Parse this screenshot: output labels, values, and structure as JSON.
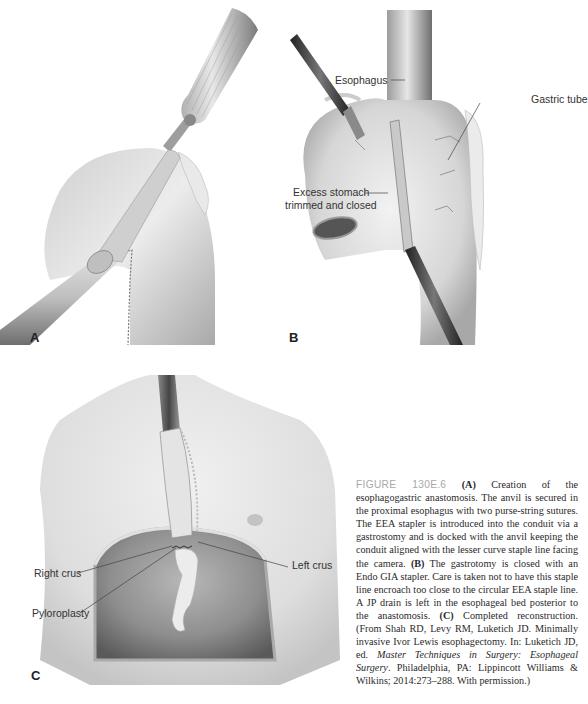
{
  "figure": {
    "number_label": "FIGURE 130E.6",
    "panels": [
      {
        "letter": "A",
        "labels": []
      },
      {
        "letter": "B",
        "labels": [
          "Esophagus",
          "Gastric tube",
          "Excess stomach",
          "trimmed and closed"
        ]
      },
      {
        "letter": "C",
        "labels": [
          "Right crus",
          "Left crus",
          "Pyloroplasty"
        ]
      }
    ]
  },
  "caption": {
    "a_marker": "(A)",
    "a_text": " Creation of the esophagogastric anastomosis. The anvil is secured in the proximal esophagus with two purse-string sutures. The EEA stapler is introduced into the conduit via a gastrostomy and is docked with the anvil keeping the conduit aligned with the lesser curve staple line facing the camera. ",
    "b_marker": "(B)",
    "b_text": " The gastrotomy is closed with an Endo GIA stapler. Care is taken not to have this staple line encroach too close to the circular EEA staple line. A JP drain is left in the esophageal bed posterior to the anastomosis. ",
    "c_marker": "(C)",
    "c_text": " Completed reconstruction. (From Shah RD, Levy RM, Luketich JD. Minimally invasive Ivor Lewis esophagectomy. In: Luketich JD, ed. ",
    "book_title": "Master Techniques in Surgery: Esophageal Surgery",
    "source_tail": ". Philadelphia, PA: Lippincott Williams & Wilkins; 2014:273–288. With permission.)"
  },
  "colors": {
    "figure_label": "#a8a8a8",
    "text": "#2a2a2a",
    "tissue": "#d9d9d9",
    "shadow": "#8c8c8c"
  }
}
